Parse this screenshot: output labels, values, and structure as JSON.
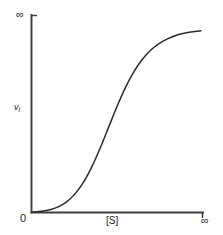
{
  "figure": {
    "kind": "sigmoidal-kinetics-plot",
    "background_color": "#ffffff",
    "axis_color": "#3d3d3d",
    "curve_color": "#2b2b2b"
  },
  "chart_data": {
    "type": "line",
    "title": "",
    "xlabel": "[S]",
    "ylabel": "v",
    "ylabel_subscript": "i",
    "ylabel_full": "vi",
    "x_tick_labels": [
      "0",
      "∞"
    ],
    "y_tick_labels": [
      "0",
      "∞"
    ],
    "origin_label": "0",
    "x_max_label": "∞",
    "y_max_label": "∞",
    "xlim": [
      0,
      1
    ],
    "ylim": [
      0,
      1
    ],
    "grid": false,
    "legend": false,
    "legend_position": "none",
    "annotations": [],
    "series": [
      {
        "name": "sigmoidal velocity curve",
        "shape": "sigmoid",
        "x": [
          0.0,
          0.05,
          0.1,
          0.15,
          0.2,
          0.25,
          0.3,
          0.35,
          0.4,
          0.45,
          0.5,
          0.55,
          0.6,
          0.65,
          0.7,
          0.75,
          0.8,
          0.85,
          0.9,
          0.95,
          1.0
        ],
        "y": [
          0.0,
          0.004,
          0.012,
          0.028,
          0.055,
          0.098,
          0.16,
          0.244,
          0.346,
          0.458,
          0.57,
          0.672,
          0.757,
          0.824,
          0.874,
          0.91,
          0.936,
          0.954,
          0.966,
          0.974,
          0.98
        ]
      }
    ]
  }
}
